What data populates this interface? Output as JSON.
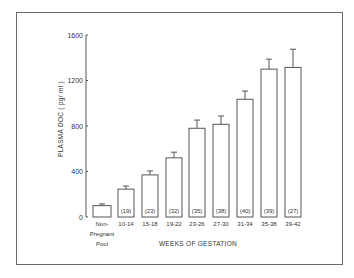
{
  "chart_data": {
    "type": "bar",
    "title": "",
    "xlabel": "WEEKS OF GESTATION",
    "ylabel": "PLASMA DOC ( pg/ ml )",
    "ylim": [
      0,
      1600
    ],
    "yticks": [
      0,
      400,
      800,
      1200,
      1600
    ],
    "ytick_labels": [
      "0",
      "400",
      "800",
      "1200",
      "1600"
    ],
    "grid": false,
    "legend": null,
    "categories": [
      "Non-Pregnant Pool",
      "10-14",
      "15-18",
      "19-22",
      "23-26",
      "27-30",
      "31-34",
      "35-38",
      "39-42"
    ],
    "category_label_lines": [
      [
        "Non-",
        "Pregnant",
        "Pool"
      ],
      [
        "10-14"
      ],
      [
        "15-18"
      ],
      [
        "19-22"
      ],
      [
        "23-26"
      ],
      [
        "27-30"
      ],
      [
        "31-34"
      ],
      [
        "35-38"
      ],
      [
        "39-42"
      ]
    ],
    "values": [
      100,
      245,
      370,
      520,
      780,
      815,
      1035,
      1300,
      1315
    ],
    "error_upper": [
      115,
      272,
      405,
      570,
      852,
      888,
      1107,
      1388,
      1475
    ],
    "n_labels": [
      "",
      "(19)",
      "(23)",
      "(32)",
      "(35)",
      "(38)",
      "(40)",
      "(39)",
      "(27)"
    ]
  },
  "style": {
    "bar_fill": "#ffffff",
    "bar_stroke": "#555555",
    "axis_color": "#555555",
    "frame_color": "#6a6a6a"
  }
}
